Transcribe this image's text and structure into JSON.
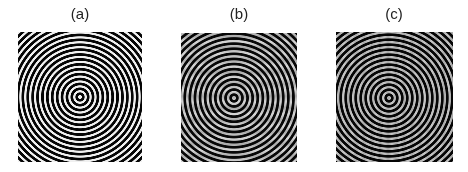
{
  "figure": {
    "panels": [
      {
        "label": "(a)",
        "description": "concentric ring pattern (zone-plate-like), clean rings"
      },
      {
        "label": "(b)",
        "description": "concentric ring pattern with noise/aliasing artifacts"
      },
      {
        "label": "(c)",
        "description": "concentric ring pattern with fine texture/artifacts"
      }
    ],
    "colors": {
      "background": "#ffffff",
      "ring_dark": "#000000",
      "ring_light": "#e0e0e0"
    }
  }
}
